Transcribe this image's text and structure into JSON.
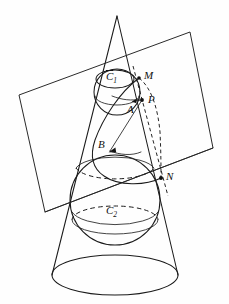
{
  "figure": {
    "labels": {
      "c1": "C",
      "c1_sub": "1",
      "c2": "C",
      "c2_sub": "2",
      "m": "M",
      "n": "N",
      "p": "P",
      "a": "A",
      "b": "B"
    },
    "colors": {
      "stroke": "#1a1a1a",
      "background": "#ffffff",
      "point": "#111111"
    },
    "geometry": {
      "apex": [
        117,
        16
      ],
      "base_ellipse": {
        "cx": 115,
        "cy": 275,
        "rx": 63,
        "ry": 20
      },
      "upper_sphere": {
        "cx": 117,
        "cy": 92,
        "r": 23
      },
      "lower_sphere": {
        "cx": 115,
        "cy": 200,
        "r": 45
      },
      "circle_c1": {
        "cx": 115,
        "cy": 79,
        "rx": 19,
        "ry": 9
      },
      "circle_c2": {
        "cx": 115,
        "cy": 220,
        "rx": 43,
        "ry": 14
      },
      "plane_corners": [
        [
          19,
          95
        ],
        [
          190,
          32
        ],
        [
          213,
          148
        ],
        [
          45,
          212
        ]
      ],
      "points": {
        "M": [
          139,
          78
        ],
        "P": [
          142,
          100
        ],
        "A": [
          133,
          102
        ],
        "B": [
          110,
          151
        ],
        "N": [
          161,
          178
        ]
      }
    }
  }
}
